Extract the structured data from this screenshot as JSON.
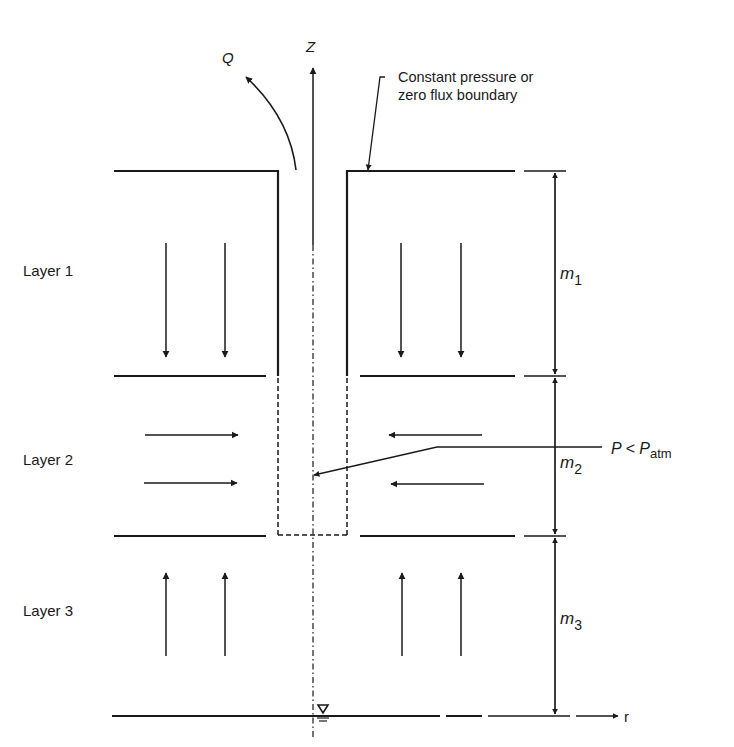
{
  "diagram": {
    "axis_z_label": "Z",
    "axis_r_label": "r",
    "flow_label": "Q",
    "boundary_note_line1": "Constant pressure or",
    "boundary_note_line2": "zero flux boundary",
    "pressure_label_main": "P < P",
    "pressure_label_sub": "atm",
    "layers": [
      {
        "label": "Layer 1",
        "thickness_symbol": "m",
        "thickness_sub": "1",
        "flow_direction": "down"
      },
      {
        "label": "Layer 2",
        "thickness_symbol": "m",
        "thickness_sub": "2",
        "flow_direction": "horizontal-toward-well"
      },
      {
        "label": "Layer 3",
        "thickness_symbol": "m",
        "thickness_sub": "3",
        "flow_direction": "up"
      }
    ],
    "water_table_symbol": "water-table-icon",
    "colors": {
      "line": "#1a1a1a",
      "background": "#ffffff"
    }
  }
}
